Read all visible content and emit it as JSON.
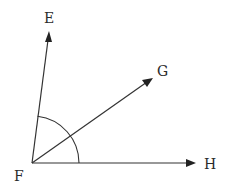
{
  "diagram": {
    "type": "angle-rays",
    "vertex": {
      "label": "F",
      "x": 32,
      "y": 163
    },
    "rays": [
      {
        "label": "E",
        "tip": {
          "x": 49,
          "y": 32
        }
      },
      {
        "label": "G",
        "tip": {
          "x": 153,
          "y": 78
        }
      },
      {
        "label": "H",
        "tip": {
          "x": 195,
          "y": 163
        }
      }
    ],
    "arc": {
      "from_ray": "H",
      "to_ray": "E",
      "radius": 47
    },
    "labels": {
      "E": "E",
      "F": "F",
      "G": "G",
      "H": "H"
    },
    "colors": {
      "stroke": "#333333",
      "background": "#ffffff"
    }
  }
}
